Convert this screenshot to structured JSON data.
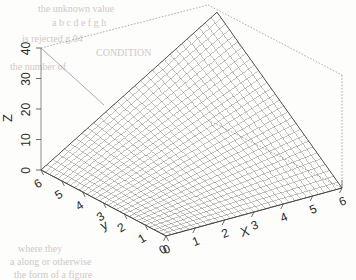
{
  "figure": {
    "kind": "3d-surface-wireframe",
    "background_color": "#fdfdfc",
    "line_color": "#4a4a4a",
    "box_color": "#7a7a7a",
    "scan_bleed_color": "#cfc9c6"
  },
  "chart_data": {
    "type": "surface",
    "title": "",
    "xlabel": "X",
    "ylabel": "y",
    "zlabel": "Z",
    "xlim": [
      0,
      6
    ],
    "ylim": [
      0,
      6
    ],
    "zlim": [
      0,
      40
    ],
    "xticks": [
      "0",
      "1",
      "2",
      "3",
      "4",
      "5",
      "6"
    ],
    "yticks": [
      "0",
      "1",
      "2",
      "3",
      "4",
      "5",
      "6"
    ],
    "zticks": [
      "0",
      "10",
      "20",
      "30",
      "40"
    ],
    "grid": false,
    "legend": "none",
    "mesh_nx": 31,
    "mesh_ny": 31,
    "surface_formula": "z = x * y",
    "corner_values": {
      "x0_y0": 0,
      "x6_y0": 0,
      "x0_y6": 0,
      "x6_y6": 36
    }
  },
  "bleed_text": [
    {
      "text": "the  unknown  value",
      "x": 38,
      "y": 3,
      "size": 10
    },
    {
      "text": "a  b  c  d  e  f  g  h",
      "x": 52,
      "y": 17,
      "size": 10
    },
    {
      "text": "is  rejected  g.04",
      "x": 22,
      "y": 33,
      "size": 10
    },
    {
      "text": "CONDITION",
      "x": 96,
      "y": 47,
      "size": 10
    },
    {
      "text": "the  number  of",
      "x": 10,
      "y": 61,
      "size": 10
    },
    {
      "text": "where  they",
      "x": 18,
      "y": 243,
      "size": 10
    },
    {
      "text": "a  along  or  otherwise",
      "x": 10,
      "y": 256,
      "size": 10
    },
    {
      "text": "the  form  of  a  figure",
      "x": 14,
      "y": 269,
      "size": 10
    }
  ]
}
